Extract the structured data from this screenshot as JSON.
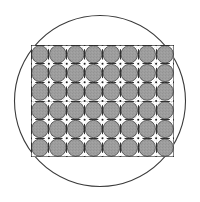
{
  "figure": {
    "canvas": {
      "width": 200,
      "height": 202
    },
    "background_color": "#ffffff",
    "enclosing_circle": {
      "icon_name": "circle-outline-icon",
      "center_x": 100,
      "center_y": 101,
      "radius": 85.5,
      "stroke_color": "#3a3a3a",
      "stroke_width": 1.1,
      "fill": "none"
    },
    "grid": {
      "icon_name": "tiled-disc-grid-icon",
      "left": 31,
      "top": 45,
      "width": 143,
      "height": 112,
      "columns": 8,
      "rows": 6,
      "cell_count": 48,
      "cell_width": 17.875,
      "cell_height": 18.667,
      "disc_fill_color": "#9e9e9e",
      "disc_radius_ratio": 0.465,
      "line_color": "#2e2e2e",
      "line_width": 1.0,
      "gap_color": "#ffffff",
      "cross_color": "#ffffff",
      "cross_arm_length": 4.2,
      "cross_arm_width": 1.6,
      "node_color": "#1c1c1c",
      "node_radius": 1.0,
      "border_color": "#2e2e2e",
      "border_width": 1.2
    },
    "texture": {
      "noise_enabled": true,
      "noise_opacity": 0.16,
      "noise_dot_color": "#5a5a5a",
      "noise_highlight_color": "#c8c8c8"
    }
  }
}
